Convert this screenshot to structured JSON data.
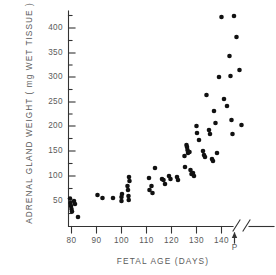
{
  "chart_data": {
    "type": "scatter",
    "title": "",
    "xlabel": "FETAL  AGE   (DAYS)",
    "ylabel": "ADRENAL  GLAND  WEIGHT  ( mg  WET  TISSUE )",
    "xlim": [
      75,
      152
    ],
    "ylim": [
      0,
      430
    ],
    "grid": false,
    "legend": null,
    "x_ticks": [
      80,
      90,
      100,
      110,
      120,
      130,
      140
    ],
    "x_tick_labels": [
      "80",
      "90",
      "100",
      "110",
      "120",
      "130",
      "140"
    ],
    "y_ticks": [
      50,
      100,
      150,
      200,
      250,
      300,
      350,
      400
    ],
    "y_tick_labels": [
      "50",
      "100",
      "150",
      "200",
      "250",
      "300",
      "350",
      "400"
    ],
    "y_minor_ticks": [
      25,
      75,
      125,
      175,
      225,
      275,
      325,
      375,
      425
    ],
    "axis_break_after": 140,
    "annotations": [
      {
        "name": "parturition-marker",
        "label": "P",
        "x": 146,
        "note": "arrow on x-axis"
      }
    ],
    "points": [
      [
        79.4,
        55
      ],
      [
        79.6,
        46
      ],
      [
        79.8,
        40
      ],
      [
        80.0,
        34
      ],
      [
        80.2,
        29
      ],
      [
        81.0,
        50
      ],
      [
        81.4,
        44
      ],
      [
        82.6,
        18
      ],
      [
        90.4,
        62
      ],
      [
        92.4,
        56
      ],
      [
        96.6,
        56
      ],
      [
        100.0,
        58
      ],
      [
        100.0,
        50
      ],
      [
        100.2,
        64
      ],
      [
        102.4,
        80
      ],
      [
        102.6,
        72
      ],
      [
        102.8,
        60
      ],
      [
        102.9,
        52
      ],
      [
        103.0,
        98
      ],
      [
        103.2,
        90
      ],
      [
        111.0,
        96
      ],
      [
        111.2,
        72
      ],
      [
        112.0,
        80
      ],
      [
        112.4,
        66
      ],
      [
        113.4,
        116
      ],
      [
        116.2,
        94
      ],
      [
        116.8,
        92
      ],
      [
        117.4,
        84
      ],
      [
        119.0,
        100
      ],
      [
        119.6,
        94
      ],
      [
        122.2,
        98
      ],
      [
        122.6,
        92
      ],
      [
        125.2,
        140
      ],
      [
        125.4,
        118
      ],
      [
        126.0,
        162
      ],
      [
        126.2,
        158
      ],
      [
        126.4,
        152
      ],
      [
        126.6,
        146
      ],
      [
        127.2,
        148
      ],
      [
        127.6,
        112
      ],
      [
        128.0,
        104
      ],
      [
        128.6,
        106
      ],
      [
        129.0,
        100
      ],
      [
        130.0,
        200
      ],
      [
        130.2,
        186
      ],
      [
        131.0,
        172
      ],
      [
        132.6,
        150
      ],
      [
        133.0,
        142
      ],
      [
        133.4,
        138
      ],
      [
        134.0,
        262
      ],
      [
        135.0,
        192
      ],
      [
        135.4,
        184
      ],
      [
        136.2,
        134
      ],
      [
        136.6,
        130
      ],
      [
        137.0,
        230
      ],
      [
        137.6,
        206
      ],
      [
        138.2,
        146
      ],
      [
        139.0,
        298
      ],
      [
        140.0,
        418
      ],
      [
        141.0,
        254
      ],
      [
        142.2,
        240
      ],
      [
        143.2,
        340
      ],
      [
        143.6,
        300
      ],
      [
        144.0,
        212
      ],
      [
        144.4,
        184
      ],
      [
        145.0,
        420
      ],
      [
        146.0,
        378
      ],
      [
        147.2,
        312
      ],
      [
        148.0,
        202
      ]
    ]
  }
}
